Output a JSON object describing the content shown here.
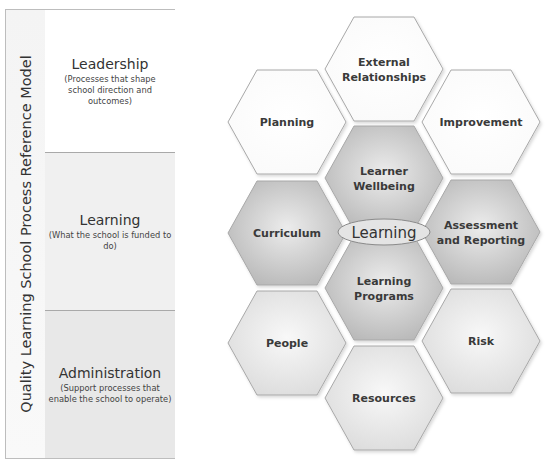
{
  "model": {
    "title": "Quality Learning School Process Reference Model",
    "sections": [
      {
        "title": "Leadership",
        "description": "(Processes that shape school direction and outcomes)"
      },
      {
        "title": "Learning",
        "description": "(What the school is funded to do)"
      },
      {
        "title": "Administration",
        "description": "(Support processes that enable the school to operate)"
      }
    ]
  },
  "hexagons": {
    "center_label": "Learning",
    "leadership": [
      {
        "name": "external-relationships",
        "lines": [
          "External",
          "Relationships"
        ]
      },
      {
        "name": "planning",
        "lines": [
          "Planning"
        ]
      },
      {
        "name": "improvement",
        "lines": [
          "Improvement"
        ]
      }
    ],
    "learning": [
      {
        "name": "learner-wellbeing",
        "lines": [
          "Learner",
          "Wellbeing"
        ]
      },
      {
        "name": "curriculum",
        "lines": [
          "Curriculum"
        ]
      },
      {
        "name": "assessment-and-reporting",
        "lines": [
          "Assessment",
          "and Reporting"
        ]
      },
      {
        "name": "learning-programs",
        "lines": [
          "Learning",
          "Programs"
        ]
      }
    ],
    "administration": [
      {
        "name": "people",
        "lines": [
          "People"
        ]
      },
      {
        "name": "risk",
        "lines": [
          "Risk"
        ]
      },
      {
        "name": "resources",
        "lines": [
          "Resources"
        ]
      }
    ]
  },
  "colors": {
    "leadership_fill": "#ffffff",
    "learning_fill": "#c4c4c4",
    "administration_fill": "#e6e6e6",
    "outline": "#a8a8a8"
  }
}
